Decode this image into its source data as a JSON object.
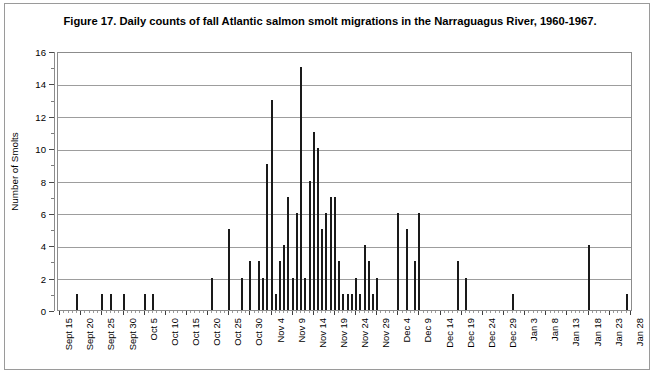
{
  "figure": {
    "title": "Figure 17. Daily counts of fall Atlantic salmon smolt migrations in the Narraguagus River, 1960-1967."
  },
  "axes": {
    "y_title": "Number of Smolts",
    "y_ticks": [
      "0",
      "2",
      "4",
      "6",
      "8",
      "10",
      "12",
      "14",
      "16"
    ],
    "x_ticks": [
      "Sept 15",
      "Sept 20",
      "Sept 25",
      "Sept 30",
      "Oct 5",
      "Oct 10",
      "Oct 15",
      "Oct 20",
      "Oct 25",
      "Oct 30",
      "Nov 4",
      "Nov 9",
      "Nov 14",
      "Nov 19",
      "Nov 24",
      "Nov 29",
      "Dec 4",
      "Dec 9",
      "Dec 14",
      "Dec 19",
      "Dec 24",
      "Dec 29",
      "Jan 3",
      "Jan 8",
      "Jan 13",
      "Jan 18",
      "Jan 23",
      "Jan 28"
    ]
  },
  "colors": {
    "bar": "#1a1a1a",
    "grid": "#9d9d9d",
    "frame": "#8c8c8c",
    "text": "#000000"
  },
  "chart_data": {
    "type": "bar",
    "title": "Figure 17. Daily counts of fall Atlantic salmon smolt migrations in the Narraguagus River, 1960-1967.",
    "xlabel": "",
    "ylabel": "Number of Smolts",
    "ylim": [
      0,
      16
    ],
    "ytick_step": 2,
    "grid": true,
    "legend": null,
    "x_tick_step_days": 5,
    "x_start": "Sept 15",
    "x_end": "Jan 28",
    "categories": [
      "Sept 15",
      "Sept 16",
      "Sept 17",
      "Sept 18",
      "Sept 19",
      "Sept 20",
      "Sept 21",
      "Sept 22",
      "Sept 23",
      "Sept 24",
      "Sept 25",
      "Sept 26",
      "Sept 27",
      "Sept 28",
      "Sept 29",
      "Sept 30",
      "Oct 1",
      "Oct 2",
      "Oct 3",
      "Oct 4",
      "Oct 5",
      "Oct 6",
      "Oct 7",
      "Oct 8",
      "Oct 9",
      "Oct 10",
      "Oct 11",
      "Oct 12",
      "Oct 13",
      "Oct 14",
      "Oct 15",
      "Oct 16",
      "Oct 17",
      "Oct 18",
      "Oct 19",
      "Oct 20",
      "Oct 21",
      "Oct 22",
      "Oct 23",
      "Oct 24",
      "Oct 25",
      "Oct 26",
      "Oct 27",
      "Oct 28",
      "Oct 29",
      "Oct 30",
      "Oct 31",
      "Nov 1",
      "Nov 2",
      "Nov 3",
      "Nov 4",
      "Nov 5",
      "Nov 6",
      "Nov 7",
      "Nov 8",
      "Nov 9",
      "Nov 10",
      "Nov 11",
      "Nov 12",
      "Nov 13",
      "Nov 14",
      "Nov 15",
      "Nov 16",
      "Nov 17",
      "Nov 18",
      "Nov 19",
      "Nov 20",
      "Nov 21",
      "Nov 22",
      "Nov 23",
      "Nov 24",
      "Nov 25",
      "Nov 26",
      "Nov 27",
      "Nov 28",
      "Nov 29",
      "Nov 30",
      "Dec 1",
      "Dec 2",
      "Dec 3",
      "Dec 4",
      "Dec 5",
      "Dec 6",
      "Dec 7",
      "Dec 8",
      "Dec 9",
      "Dec 10",
      "Dec 11",
      "Dec 12",
      "Dec 13",
      "Dec 14",
      "Dec 15",
      "Dec 16",
      "Dec 17",
      "Dec 18",
      "Dec 19",
      "Dec 20",
      "Dec 21",
      "Dec 22",
      "Dec 23",
      "Dec 24",
      "Dec 25",
      "Dec 26",
      "Dec 27",
      "Dec 28",
      "Dec 29",
      "Dec 30",
      "Dec 31",
      "Jan 1",
      "Jan 2",
      "Jan 3",
      "Jan 4",
      "Jan 5",
      "Jan 6",
      "Jan 7",
      "Jan 8",
      "Jan 9",
      "Jan 10",
      "Jan 11",
      "Jan 12",
      "Jan 13",
      "Jan 14",
      "Jan 15",
      "Jan 16",
      "Jan 17",
      "Jan 18",
      "Jan 19",
      "Jan 20",
      "Jan 21",
      "Jan 22",
      "Jan 23",
      "Jan 24",
      "Jan 25",
      "Jan 26",
      "Jan 27",
      "Jan 28"
    ],
    "values": [
      0,
      0,
      0,
      0,
      1,
      0,
      0,
      0,
      0,
      0,
      1,
      0,
      1,
      0,
      0,
      1,
      0,
      0,
      0,
      0,
      1,
      0,
      1,
      0,
      0,
      0,
      0,
      0,
      0,
      0,
      0,
      0,
      0,
      0,
      0,
      0,
      2,
      0,
      0,
      0,
      5,
      0,
      0,
      2,
      0,
      3,
      0,
      3,
      2,
      9,
      13,
      1,
      3,
      4,
      7,
      2,
      6,
      15,
      2,
      8,
      11,
      10,
      5,
      6,
      7,
      7,
      3,
      1,
      1,
      1,
      2,
      1,
      4,
      3,
      1,
      2,
      0,
      0,
      0,
      0,
      6,
      0,
      5,
      0,
      3,
      6,
      0,
      0,
      0,
      0,
      0,
      0,
      0,
      0,
      3,
      0,
      2,
      0,
      0,
      0,
      0,
      0,
      0,
      0,
      0,
      0,
      0,
      1,
      0,
      0,
      0,
      0,
      0,
      0,
      0,
      0,
      0,
      0,
      0,
      0,
      0,
      0,
      0,
      0,
      0,
      4,
      0,
      0,
      0,
      0,
      0,
      0,
      0,
      0,
      1,
      0
    ]
  }
}
